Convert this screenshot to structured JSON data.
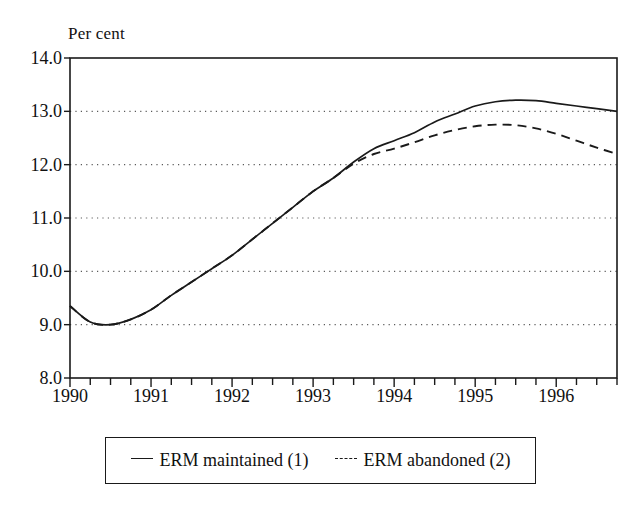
{
  "chart_data": {
    "type": "line",
    "title": "",
    "subtitle": "",
    "unit_label": "Per cent",
    "xlabel": "",
    "ylabel": "Per cent",
    "ylim": [
      8.0,
      14.0
    ],
    "xlim": [
      1990.0,
      1996.75
    ],
    "grid": true,
    "grid_axis": "y",
    "grid_style": "dotted",
    "legend_position": "below-plot-centered",
    "y_ticks": [
      "8.0",
      "9.0",
      "10.0",
      "11.0",
      "12.0",
      "13.0",
      "14.0"
    ],
    "y_tick_values": [
      8.0,
      9.0,
      10.0,
      11.0,
      12.0,
      13.0,
      14.0
    ],
    "x_tick_labels": [
      "1990",
      "1991",
      "1992",
      "1993",
      "1994",
      "1995",
      "1996"
    ],
    "x_tick_values": [
      1990,
      1991,
      1992,
      1993,
      1994,
      1995,
      1996
    ],
    "x_minor_tick_interval": 0.25,
    "x": [
      1990.0,
      1990.25,
      1990.5,
      1990.75,
      1991.0,
      1991.25,
      1991.5,
      1991.75,
      1992.0,
      1992.25,
      1992.5,
      1992.75,
      1993.0,
      1993.25,
      1993.5,
      1993.75,
      1994.0,
      1994.25,
      1994.5,
      1994.75,
      1995.0,
      1995.25,
      1995.5,
      1995.75,
      1996.0,
      1996.25,
      1996.5,
      1996.75
    ],
    "series": [
      {
        "name": "ERM maintained (1)",
        "style": "solid",
        "color": "#1a1a1a",
        "values": [
          9.35,
          9.05,
          9.0,
          9.1,
          9.28,
          9.55,
          9.8,
          10.05,
          10.3,
          10.6,
          10.9,
          11.2,
          11.5,
          11.75,
          12.05,
          12.3,
          12.45,
          12.6,
          12.8,
          12.95,
          13.1,
          13.18,
          13.21,
          13.2,
          13.15,
          13.1,
          13.05,
          13.0
        ]
      },
      {
        "name": "ERM abandoned (2)",
        "style": "dashed",
        "color": "#1a1a1a",
        "values": [
          9.35,
          9.05,
          9.0,
          9.1,
          9.28,
          9.55,
          9.8,
          10.05,
          10.3,
          10.6,
          10.9,
          11.2,
          11.5,
          11.75,
          12.02,
          12.2,
          12.3,
          12.42,
          12.55,
          12.65,
          12.72,
          12.75,
          12.74,
          12.68,
          12.58,
          12.45,
          12.32,
          12.2
        ]
      }
    ],
    "legend": [
      {
        "label": "ERM maintained (1)",
        "style": "solid"
      },
      {
        "label": "ERM abandoned (2)",
        "style": "dashed"
      }
    ]
  },
  "plot_geometry": {
    "left": 70,
    "right": 617,
    "top": 58,
    "bottom": 378
  },
  "colors": {
    "line": "#1a1a1a",
    "axis": "#1a1a1a",
    "grid": "#5a5a5a",
    "background": "#ffffff"
  }
}
